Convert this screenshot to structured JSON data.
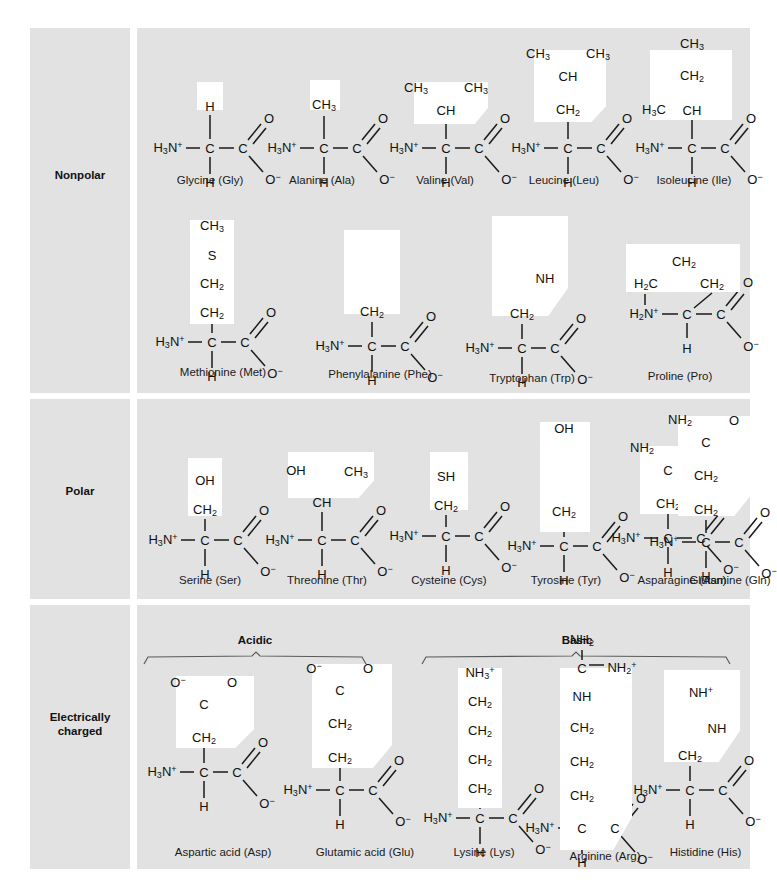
{
  "figure": {
    "panel_background": "#e2e2e2",
    "page_background": "#ffffff",
    "highlight_color": "#ffffff"
  },
  "categories": [
    {
      "id": "nonpolar",
      "label": "Nonpolar"
    },
    {
      "id": "polar",
      "label": "Polar"
    },
    {
      "id": "charged",
      "label": "Electrically\ncharged",
      "line1": "Electrically",
      "line2": "charged"
    }
  ],
  "subgroups": [
    {
      "id": "acidic",
      "label": "Acidic"
    },
    {
      "id": "basic",
      "label": "Basic"
    }
  ],
  "common_atoms": {
    "amino": "H3N+",
    "alpha_carbon": "C",
    "alpha_hydrogen": "H",
    "carboxyl_carbon": "C",
    "carbonyl_oxygen": "O",
    "carboxylate_oxygen": "O-"
  },
  "amino_acids": {
    "nonpolar": [
      {
        "name": "Glycine (Gly)",
        "code": "Gly",
        "r_group": [
          "H"
        ]
      },
      {
        "name": "Alanine (Ala)",
        "code": "Ala",
        "r_group": [
          "CH3"
        ]
      },
      {
        "name": "Valine (Val)",
        "code": "Val",
        "r_group": [
          "CH3",
          "CH3",
          "CH"
        ]
      },
      {
        "name": "Leucine (Leu)",
        "code": "Leu",
        "r_group": [
          "CH3",
          "CH3",
          "CH",
          "CH2"
        ]
      },
      {
        "name": "Isoleucine (Ile)",
        "code": "Ile",
        "r_group": [
          "CH3",
          "CH2",
          "H3C",
          "CH"
        ]
      },
      {
        "name": "Methionine (Met)",
        "code": "Met",
        "r_group": [
          "CH3",
          "S",
          "CH2",
          "CH2"
        ]
      },
      {
        "name": "Phenylalanine (Phe)",
        "code": "Phe",
        "r_group": [
          "benzene-ring",
          "CH2"
        ]
      },
      {
        "name": "Tryptophan (Trp)",
        "code": "Trp",
        "r_group": [
          "indole-ring",
          "NH",
          "CH2"
        ]
      },
      {
        "name": "Proline (Pro)",
        "code": "Pro",
        "r_group": [
          "CH2",
          "H2C",
          "CH2"
        ],
        "amino": "H2N+"
      }
    ],
    "polar": [
      {
        "name": "Serine (Ser)",
        "code": "Ser",
        "r_group": [
          "OH",
          "CH2"
        ]
      },
      {
        "name": "Threonine (Thr)",
        "code": "Thr",
        "r_group": [
          "OH",
          "CH3",
          "CH"
        ]
      },
      {
        "name": "Cysteine (Cys)",
        "code": "Cys",
        "r_group": [
          "SH",
          "CH2"
        ]
      },
      {
        "name": "Tyrosine (Tyr)",
        "code": "Tyr",
        "r_group": [
          "OH",
          "benzene-ring",
          "CH2"
        ]
      },
      {
        "name": "Asparagine (Asn)",
        "code": "Asn",
        "r_group": [
          "NH2",
          "O",
          "C",
          "CH2"
        ]
      },
      {
        "name": "Glutamine (Gln)",
        "code": "Gln",
        "r_group": [
          "NH2",
          "O",
          "C",
          "CH2",
          "CH2"
        ]
      }
    ],
    "acidic": [
      {
        "name": "Aspartic acid (Asp)",
        "code": "Asp",
        "r_group": [
          "O-",
          "O",
          "C",
          "CH2"
        ]
      },
      {
        "name": "Glutamic acid (Glu)",
        "code": "Glu",
        "r_group": [
          "O-",
          "O",
          "C",
          "CH2",
          "CH2"
        ]
      }
    ],
    "basic": [
      {
        "name": "Lysine (Lys)",
        "code": "Lys",
        "r_group": [
          "NH3+",
          "CH2",
          "CH2",
          "CH2",
          "CH2"
        ]
      },
      {
        "name": "Arginine (Arg)",
        "code": "Arg",
        "r_group": [
          "NH2",
          "C",
          "NH2+",
          "NH",
          "CH2",
          "CH2",
          "CH2"
        ]
      },
      {
        "name": "Histidine (His)",
        "code": "His",
        "r_group": [
          "NH+",
          "NH",
          "imidazole-ring",
          "CH2"
        ]
      }
    ]
  }
}
